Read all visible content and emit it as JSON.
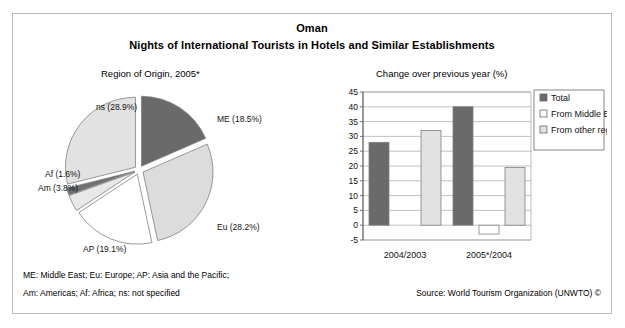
{
  "header": {
    "country": "Oman",
    "subtitle": "Nights of International Tourists in Hotels and Similar Establishments"
  },
  "panels": {
    "pie_heading": "Region of Origin, 2005*",
    "bar_heading": "Change over previous year (%)"
  },
  "footer": {
    "note_line_1": "ME: Middle East; Eu: Europe; AP: Asia and the Pacific;",
    "note_line_2": "Am: Americas; Af: Africa; ns: not specified",
    "source": "Source: World Tourism Organization (UNWTO) ©"
  },
  "colors": {
    "dark_gray": "#6a6a6a",
    "light_gray": "#e2e2e2",
    "white": "#ffffff",
    "mid_gray": "#cfcfcf",
    "outline": "#808080",
    "gridline": "#a8a8a8",
    "frame": "#b9b9b9"
  },
  "chart_data": [
    {
      "type": "pie",
      "title": "Region of Origin, 2005*",
      "legend_position": "labels-outside",
      "categories": [
        "ME",
        "Eu",
        "AP",
        "Am",
        "Af",
        "ns"
      ],
      "values": [
        18.5,
        28.2,
        19.1,
        3.8,
        1.6,
        28.9
      ],
      "unit": "%",
      "labels": [
        "ME (18.5%)",
        "Eu (28.2%)",
        "AP (19.1%)",
        "Am (3.8%)",
        "Af (1.6%)",
        "ns (28.9%)"
      ],
      "slice_colors": [
        "#6a6a6a",
        "#dcdcdc",
        "#ffffff",
        "#e8e8e8",
        "#707070",
        "#e2e2e2"
      ],
      "exploded": true
    },
    {
      "type": "bar",
      "title": "Change over previous year (%)",
      "categories": [
        "2004/2003",
        "2005*/2004"
      ],
      "series": [
        {
          "name": "Total",
          "values": [
            28,
            40
          ],
          "color": "#6a6a6a"
        },
        {
          "name": "From Middle East",
          "values": [
            null,
            -3
          ],
          "color": "#ffffff"
        },
        {
          "name": "From other regions",
          "values": [
            32,
            19.5
          ],
          "color": "#e2e2e2"
        }
      ],
      "ylabel": "",
      "xlabel": "",
      "ylim": [
        -5,
        45
      ],
      "ytick_step": 5,
      "yticks": [
        45,
        40,
        35,
        30,
        25,
        20,
        15,
        10,
        5,
        0,
        -5
      ],
      "grid": true,
      "legend_position": "right"
    }
  ]
}
